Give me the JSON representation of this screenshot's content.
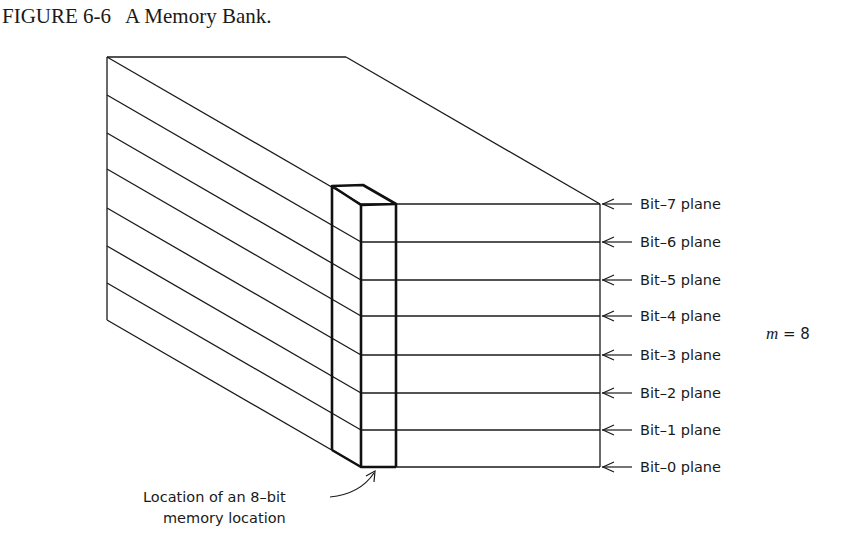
{
  "caption": {
    "figure_number": "FIGURE 6-6",
    "title": "A Memory Bank."
  },
  "diagram": {
    "type": "isometric-memory-bank",
    "bit_planes": [
      {
        "label": "Bit–7 plane",
        "y": 204
      },
      {
        "label": "Bit–6 plane",
        "y": 242
      },
      {
        "label": "Bit–5 plane",
        "y": 280
      },
      {
        "label": "Bit–4 plane",
        "y": 316
      },
      {
        "label": "Bit–3 plane",
        "y": 355
      },
      {
        "label": "Bit–2 plane",
        "y": 393
      },
      {
        "label": "Bit–1 plane",
        "y": 430
      },
      {
        "label": "Bit–0 plane",
        "y": 467
      }
    ],
    "plane_count_label": {
      "var": "m",
      "eq": "= 8"
    },
    "location_label": {
      "line1": "Location of an 8–bit",
      "line2": "memory location"
    },
    "colors": {
      "ink": "#1a1a1a",
      "background": "#ffffff"
    }
  }
}
